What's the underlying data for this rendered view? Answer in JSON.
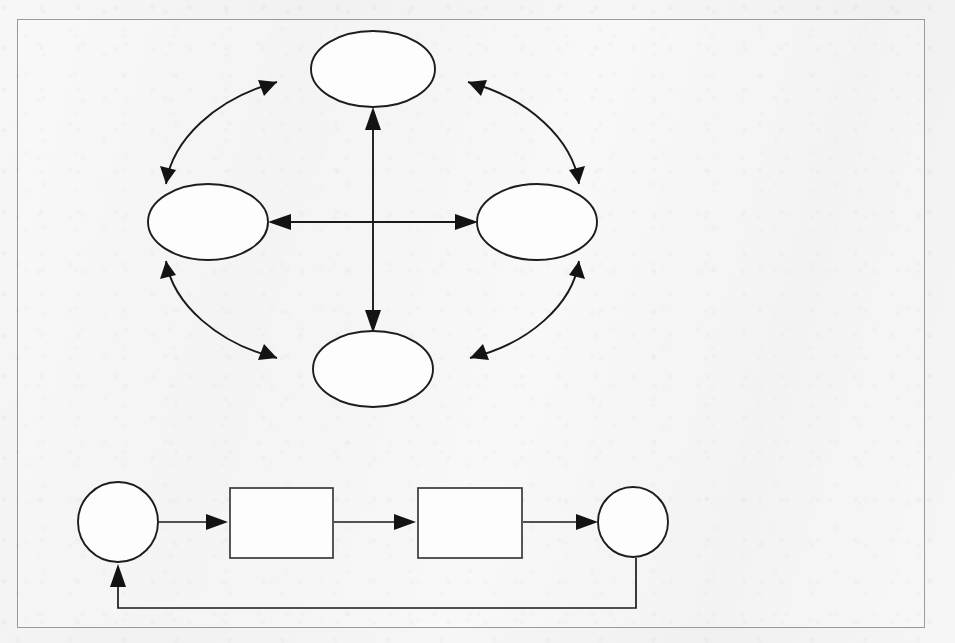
{
  "page": {
    "width": 955,
    "height": 643,
    "background_color": "#f4f4f5",
    "paper_tone": "#f2f2f3",
    "ink_color": "#1a1a1a"
  },
  "ghost_text": {
    "note": "faint show-through text from reverse side of the scanned page, largely illegible",
    "heading": "",
    "left_fragment": "",
    "column_paragraph": ""
  },
  "figure_frame": {
    "label": "figure-border",
    "x": 17,
    "y": 19,
    "width": 908,
    "height": 609,
    "border_color": "#9a9a9e",
    "border_width": 1.3
  },
  "diagrams": [
    {
      "id": "cycle-diagram",
      "type": "diamond-cycle",
      "description": "Four empty ellipses arranged in a diamond, connected by outward-bulging double-headed curved arrows around the ring, plus straight double-headed arrows crossing through the centre vertically and horizontally.",
      "nodes": [
        {
          "id": "node-top",
          "label": "",
          "shape": "ellipse",
          "cx": 373,
          "cy": 69,
          "rx": 62,
          "ry": 38
        },
        {
          "id": "node-left",
          "label": "",
          "shape": "ellipse",
          "cx": 208,
          "cy": 222,
          "rx": 60,
          "ry": 38
        },
        {
          "id": "node-right",
          "label": "",
          "shape": "ellipse",
          "cx": 537,
          "cy": 222,
          "rx": 60,
          "ry": 38
        },
        {
          "id": "node-bottom",
          "label": "",
          "shape": "ellipse",
          "cx": 373,
          "cy": 369,
          "rx": 60,
          "ry": 38
        }
      ],
      "edges": [
        {
          "id": "edge-left-top",
          "from": "node-left",
          "to": "node-top",
          "style": "curved",
          "arrows": "both",
          "label": ""
        },
        {
          "id": "edge-top-right",
          "from": "node-top",
          "to": "node-right",
          "style": "curved",
          "arrows": "both",
          "label": ""
        },
        {
          "id": "edge-right-bottom",
          "from": "node-right",
          "to": "node-bottom",
          "style": "curved",
          "arrows": "both",
          "label": ""
        },
        {
          "id": "edge-bottom-left",
          "from": "node-bottom",
          "to": "node-left",
          "style": "curved",
          "arrows": "both",
          "label": ""
        },
        {
          "id": "edge-vertical",
          "from": "node-bottom",
          "to": "node-top",
          "style": "straight",
          "arrows": "both",
          "label": ""
        },
        {
          "id": "edge-horizontal",
          "from": "node-left",
          "to": "node-right",
          "style": "straight",
          "arrows": "both",
          "label": ""
        }
      ]
    },
    {
      "id": "flow-diagram",
      "type": "linear-feedback-flow",
      "description": "Circle, rectangle, rectangle, circle connected left to right by single-headed arrows, with a feedback line running from the final circle back around to the first circle.",
      "nodes": [
        {
          "id": "flow-start",
          "label": "",
          "shape": "circle",
          "cx": 118,
          "cy": 522,
          "r": 40
        },
        {
          "id": "flow-step-1",
          "label": "",
          "shape": "rectangle",
          "x": 230,
          "y": 488,
          "width": 103,
          "height": 70
        },
        {
          "id": "flow-step-2",
          "label": "",
          "shape": "rectangle",
          "x": 418,
          "y": 488,
          "width": 104,
          "height": 70
        },
        {
          "id": "flow-end",
          "label": "",
          "shape": "circle",
          "cx": 633,
          "cy": 522,
          "r": 35
        }
      ],
      "edges": [
        {
          "id": "flow-edge-1",
          "from": "flow-start",
          "to": "flow-step-1",
          "style": "straight",
          "arrows": "forward",
          "label": ""
        },
        {
          "id": "flow-edge-2",
          "from": "flow-step-1",
          "to": "flow-step-2",
          "style": "straight",
          "arrows": "forward",
          "label": ""
        },
        {
          "id": "flow-edge-3",
          "from": "flow-step-2",
          "to": "flow-end",
          "style": "straight",
          "arrows": "forward",
          "label": ""
        },
        {
          "id": "flow-edge-feedback",
          "from": "flow-end",
          "to": "flow-start",
          "style": "orthogonal",
          "arrows": "forward",
          "label": ""
        }
      ]
    }
  ]
}
